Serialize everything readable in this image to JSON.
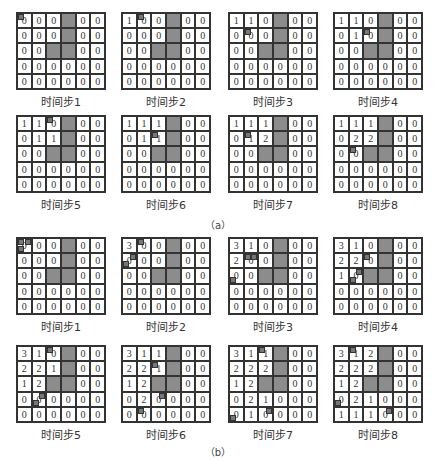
{
  "figure": {
    "captions": {
      "a": "（a）",
      "b": "（b）"
    },
    "obstacles": [
      [
        0,
        3
      ],
      [
        1,
        3
      ],
      [
        2,
        2
      ],
      [
        2,
        3
      ]
    ],
    "colors": {
      "obstacle": "#8c8c8c",
      "grid_line": "#333333",
      "background": "#ffffff"
    },
    "panel_a": [
      {
        "label": "时间步1",
        "values": [
          [
            0,
            0,
            0,
            null,
            0,
            0
          ],
          [
            0,
            0,
            0,
            null,
            0,
            0
          ],
          [
            0,
            0,
            null,
            null,
            0,
            0
          ],
          [
            0,
            0,
            0,
            0,
            0,
            0
          ],
          [
            0,
            0,
            0,
            0,
            0,
            0
          ]
        ],
        "markers": [
          [
            0,
            0,
            "tl"
          ]
        ]
      },
      {
        "label": "时间步2",
        "values": [
          [
            1,
            0,
            0,
            null,
            0,
            0
          ],
          [
            0,
            0,
            0,
            null,
            0,
            0
          ],
          [
            0,
            0,
            null,
            null,
            0,
            0
          ],
          [
            0,
            0,
            0,
            0,
            0,
            0
          ],
          [
            0,
            0,
            0,
            0,
            0,
            0
          ]
        ],
        "markers": [
          [
            0,
            1,
            "tl"
          ]
        ]
      },
      {
        "label": "时间步3",
        "values": [
          [
            1,
            1,
            0,
            null,
            0,
            0
          ],
          [
            0,
            0,
            0,
            null,
            0,
            0
          ],
          [
            0,
            0,
            null,
            null,
            0,
            0
          ],
          [
            0,
            0,
            0,
            0,
            0,
            0
          ],
          [
            0,
            0,
            0,
            0,
            0,
            0
          ]
        ],
        "markers": [
          [
            1,
            1,
            "tl"
          ]
        ]
      },
      {
        "label": "时间步4",
        "values": [
          [
            1,
            1,
            0,
            null,
            0,
            0
          ],
          [
            0,
            1,
            0,
            null,
            0,
            0
          ],
          [
            0,
            0,
            null,
            null,
            0,
            0
          ],
          [
            0,
            0,
            0,
            0,
            0,
            0
          ],
          [
            0,
            0,
            0,
            0,
            0,
            0
          ]
        ],
        "markers": [
          [
            1,
            2,
            "tl"
          ]
        ]
      },
      {
        "label": "时间步5",
        "values": [
          [
            1,
            1,
            0,
            null,
            0,
            0
          ],
          [
            0,
            1,
            1,
            null,
            0,
            0
          ],
          [
            0,
            0,
            null,
            null,
            0,
            0
          ],
          [
            0,
            0,
            0,
            0,
            0,
            0
          ],
          [
            0,
            0,
            0,
            0,
            0,
            0
          ]
        ],
        "markers": [
          [
            0,
            2,
            "tl"
          ]
        ]
      },
      {
        "label": "时间步6",
        "values": [
          [
            1,
            1,
            1,
            null,
            0,
            0
          ],
          [
            0,
            1,
            1,
            null,
            0,
            0
          ],
          [
            0,
            0,
            null,
            null,
            0,
            0
          ],
          [
            0,
            0,
            0,
            0,
            0,
            0
          ],
          [
            0,
            0,
            0,
            0,
            0,
            0
          ]
        ],
        "markers": [
          [
            1,
            2,
            "tl"
          ]
        ]
      },
      {
        "label": "时间步7",
        "values": [
          [
            1,
            1,
            1,
            null,
            0,
            0
          ],
          [
            0,
            1,
            2,
            null,
            0,
            0
          ],
          [
            0,
            0,
            null,
            null,
            0,
            0
          ],
          [
            0,
            0,
            0,
            0,
            0,
            0
          ],
          [
            0,
            0,
            0,
            0,
            0,
            0
          ]
        ],
        "markers": [
          [
            1,
            1,
            "tl"
          ]
        ]
      },
      {
        "label": "时间步8",
        "values": [
          [
            1,
            1,
            1,
            null,
            0,
            0
          ],
          [
            0,
            2,
            2,
            null,
            0,
            0
          ],
          [
            0,
            0,
            null,
            null,
            0,
            0
          ],
          [
            0,
            0,
            0,
            0,
            0,
            0
          ],
          [
            0,
            0,
            0,
            0,
            0,
            0
          ]
        ],
        "markers": [
          [
            2,
            1,
            "tl"
          ]
        ]
      }
    ],
    "panel_b": [
      {
        "label": "时间步1",
        "values": [
          [
            0,
            0,
            0,
            null,
            0,
            0
          ],
          [
            0,
            0,
            0,
            null,
            0,
            0
          ],
          [
            0,
            0,
            null,
            null,
            0,
            0
          ],
          [
            0,
            0,
            0,
            0,
            0,
            0
          ],
          [
            0,
            0,
            0,
            0,
            0,
            0
          ]
        ],
        "markers": [
          [
            0,
            0,
            "tl"
          ],
          [
            0,
            0,
            "tr"
          ],
          [
            0,
            0,
            "bl"
          ]
        ]
      },
      {
        "label": "时间步2",
        "values": [
          [
            3,
            0,
            0,
            null,
            0,
            0
          ],
          [
            0,
            0,
            0,
            null,
            0,
            0
          ],
          [
            0,
            0,
            null,
            null,
            0,
            0
          ],
          [
            0,
            0,
            0,
            0,
            0,
            0
          ],
          [
            0,
            0,
            0,
            0,
            0,
            0
          ]
        ],
        "markers": [
          [
            0,
            1,
            "tl"
          ],
          [
            1,
            0,
            "tr"
          ],
          [
            1,
            0,
            "bl"
          ]
        ]
      },
      {
        "label": "时间步3",
        "values": [
          [
            3,
            1,
            0,
            null,
            0,
            0
          ],
          [
            2,
            0,
            0,
            null,
            0,
            0
          ],
          [
            0,
            0,
            null,
            null,
            0,
            0
          ],
          [
            0,
            0,
            0,
            0,
            0,
            0
          ],
          [
            0,
            0,
            0,
            0,
            0,
            0
          ]
        ],
        "markers": [
          [
            1,
            1,
            "tl"
          ],
          [
            1,
            1,
            "tr"
          ],
          [
            2,
            0,
            "bl"
          ]
        ]
      },
      {
        "label": "时间步4",
        "values": [
          [
            3,
            1,
            0,
            null,
            0,
            0
          ],
          [
            2,
            2,
            0,
            null,
            0,
            0
          ],
          [
            1,
            0,
            null,
            null,
            0,
            0
          ],
          [
            0,
            0,
            0,
            0,
            0,
            0
          ],
          [
            0,
            0,
            0,
            0,
            0,
            0
          ]
        ],
        "markers": [
          [
            1,
            2,
            "tl"
          ],
          [
            2,
            1,
            "tr"
          ],
          [
            2,
            1,
            "bl"
          ]
        ]
      },
      {
        "label": "时间步5",
        "values": [
          [
            3,
            1,
            0,
            null,
            0,
            0
          ],
          [
            2,
            2,
            1,
            null,
            0,
            0
          ],
          [
            1,
            2,
            null,
            null,
            0,
            0
          ],
          [
            0,
            0,
            0,
            0,
            0,
            0
          ],
          [
            0,
            0,
            0,
            0,
            0,
            0
          ]
        ],
        "markers": [
          [
            0,
            2,
            "tl"
          ],
          [
            3,
            1,
            "tr"
          ],
          [
            3,
            1,
            "bl"
          ]
        ]
      },
      {
        "label": "时间步6",
        "values": [
          [
            3,
            1,
            1,
            null,
            0,
            0
          ],
          [
            2,
            2,
            1,
            null,
            0,
            0
          ],
          [
            1,
            2,
            null,
            null,
            0,
            0
          ],
          [
            0,
            2,
            0,
            0,
            0,
            0
          ],
          [
            0,
            0,
            0,
            0,
            0,
            0
          ]
        ],
        "markers": [
          [
            1,
            2,
            "tl"
          ],
          [
            3,
            2,
            "tr"
          ],
          [
            4,
            1,
            "tl"
          ]
        ]
      },
      {
        "label": "时间步7",
        "values": [
          [
            3,
            1,
            1,
            null,
            0,
            0
          ],
          [
            2,
            2,
            2,
            null,
            0,
            0
          ],
          [
            1,
            2,
            null,
            null,
            0,
            0
          ],
          [
            0,
            2,
            1,
            0,
            0,
            0
          ],
          [
            0,
            1,
            0,
            0,
            0,
            0
          ]
        ],
        "markers": [
          [
            0,
            2,
            "tl"
          ],
          [
            4,
            2,
            "tr"
          ],
          [
            4,
            0,
            "bl"
          ]
        ]
      },
      {
        "label": "时间步8",
        "values": [
          [
            3,
            1,
            2,
            null,
            0,
            0
          ],
          [
            2,
            2,
            2,
            null,
            0,
            0
          ],
          [
            1,
            2,
            null,
            null,
            0,
            0
          ],
          [
            0,
            2,
            1,
            0,
            0,
            0
          ],
          [
            1,
            1,
            1,
            0,
            0,
            0
          ]
        ],
        "markers": [
          [
            0,
            1,
            "tl"
          ],
          [
            4,
            3,
            "tr"
          ],
          [
            3,
            0,
            "bl"
          ]
        ]
      }
    ]
  }
}
